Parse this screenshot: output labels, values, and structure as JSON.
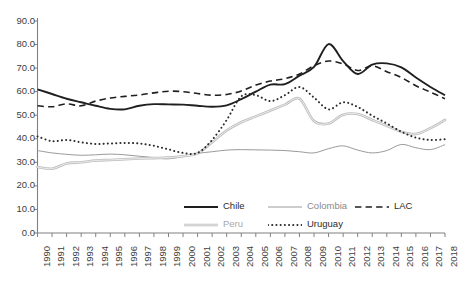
{
  "chart_data": {
    "type": "line",
    "title": "",
    "subtitle": "",
    "xlabel": "",
    "ylabel": "",
    "xlim": [
      1990,
      2018
    ],
    "ylim": [
      0,
      90
    ],
    "ytick_step": 10,
    "grid": false,
    "legend_position": "bottom",
    "x": [
      1990,
      1991,
      1992,
      1993,
      1994,
      1995,
      1996,
      1997,
      1998,
      1999,
      2000,
      2001,
      2002,
      2003,
      2004,
      2005,
      2006,
      2007,
      2008,
      2009,
      2010,
      2011,
      2012,
      2013,
      2014,
      2015,
      2016,
      2017,
      2018
    ],
    "xtick_labels": [
      "1990",
      "1991",
      "1992",
      "1993",
      "1994",
      "1995",
      "1996",
      "1997",
      "1998",
      "1999",
      "2000",
      "2001",
      "2002",
      "2003",
      "2004",
      "2005",
      "2006",
      "2007",
      "2008",
      "2009",
      "2010",
      "2011",
      "2012",
      "2013",
      "2014",
      "2015",
      "2016",
      "2017",
      "2018"
    ],
    "ytick_labels": [
      "0.0",
      "10.0",
      "20.0",
      "30.0",
      "40.0",
      "50.0",
      "60.0",
      "70.0",
      "80.0",
      "90.0"
    ],
    "ytick_values": [
      0,
      10,
      20,
      30,
      40,
      50,
      60,
      70,
      80,
      90
    ],
    "series": [
      {
        "name": "Chile",
        "style": "solid",
        "color": "#1f1f1f",
        "width": 1.9,
        "values": [
          61.0,
          59.0,
          57.0,
          55.5,
          54.0,
          52.7,
          52.5,
          54.0,
          54.7,
          54.6,
          54.5,
          54.0,
          53.6,
          54.2,
          56.8,
          60.0,
          63.0,
          63.2,
          66.8,
          70.5,
          80.2,
          73.0,
          67.5,
          71.5,
          72.0,
          70.3,
          66.0,
          62.0,
          58.5
        ]
      },
      {
        "name": "Colombia",
        "style": "solid",
        "color": "#9a9a9a",
        "width": 1.0,
        "values": [
          35.0,
          34.0,
          33.4,
          33.0,
          33.2,
          33.5,
          33.2,
          32.6,
          32.0,
          31.5,
          32.5,
          33.8,
          34.5,
          35.2,
          35.4,
          35.3,
          35.2,
          35.0,
          34.5,
          34.0,
          35.8,
          37.0,
          35.2,
          34.0,
          35.0,
          37.6,
          36.2,
          35.4,
          37.5
        ]
      },
      {
        "name": "LAC",
        "style": "dashed",
        "color": "#1f1f1f",
        "width": 1.6,
        "values": [
          54.0,
          53.6,
          54.8,
          54.0,
          56.0,
          57.3,
          58.0,
          58.6,
          59.5,
          60.2,
          60.0,
          59.2,
          58.5,
          58.8,
          60.3,
          62.8,
          64.5,
          65.5,
          67.5,
          71.0,
          73.0,
          71.8,
          69.0,
          71.0,
          68.5,
          66.0,
          62.5,
          59.8,
          57.0
        ]
      },
      {
        "name": "Peru",
        "style": "solid-double",
        "color": "#bdbdbd",
        "width": 2.6,
        "values": [
          28.0,
          27.3,
          29.5,
          30.0,
          30.8,
          31.0,
          31.3,
          31.6,
          31.8,
          32.0,
          32.6,
          33.8,
          38.5,
          43.5,
          47.0,
          49.5,
          52.0,
          54.5,
          57.0,
          47.5,
          46.5,
          50.2,
          50.5,
          48.0,
          45.5,
          43.0,
          42.0,
          44.5,
          48.0
        ]
      },
      {
        "name": "Uruguay",
        "style": "dotted",
        "color": "#2b2b2b",
        "width": 2.0,
        "values": [
          41.0,
          39.0,
          39.5,
          38.5,
          37.8,
          38.0,
          38.2,
          38.0,
          37.0,
          35.5,
          34.0,
          34.0,
          39.5,
          48.0,
          58.0,
          58.5,
          56.0,
          58.5,
          62.0,
          57.5,
          52.5,
          55.5,
          53.5,
          49.8,
          46.5,
          43.0,
          40.5,
          39.5,
          39.8
        ]
      }
    ]
  },
  "legend": {
    "entries": [
      {
        "label": "Chile",
        "series": "Chile"
      },
      {
        "label": "Colombia",
        "series": "Colombia"
      },
      {
        "label": "LAC",
        "series": "LAC"
      },
      {
        "label": "Peru",
        "series": "Peru"
      },
      {
        "label": "Uruguay",
        "series": "Uruguay"
      }
    ]
  },
  "caption": {
    "text": ""
  },
  "colors": {
    "axis": "#808080",
    "text": "#404040",
    "background": "#ffffff"
  }
}
